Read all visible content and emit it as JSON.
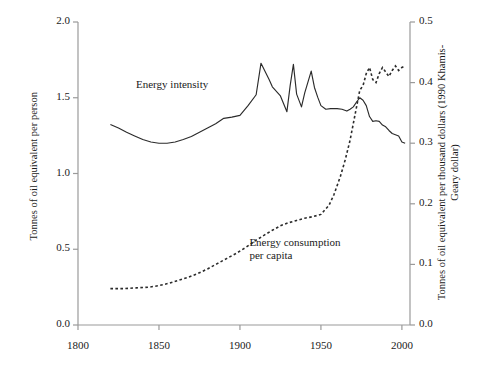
{
  "chart_data": {
    "type": "line",
    "title": "",
    "xlabel": "",
    "ylabel": "Tonnes of oil equivalent per person",
    "ylabel_right": "Tonnes of oil equivalent per thousand dollars (1990 Khamis-Geary dollar)",
    "xlim": [
      1800,
      2005
    ],
    "ylim": [
      0.0,
      2.0
    ],
    "ylim_right": [
      0.0,
      0.5
    ],
    "xticks": [
      1800,
      1850,
      1900,
      1950,
      2000
    ],
    "xticklabels": [
      "1800",
      "1850",
      "1900",
      "1950",
      "2000"
    ],
    "yticks": [
      0.0,
      0.5,
      1.0,
      1.5,
      2.0
    ],
    "yticklabels": [
      "0.0",
      "0.5",
      "1.0",
      "1.5",
      "2.0"
    ],
    "yticks_right": [
      0.0,
      0.1,
      0.2,
      0.3,
      0.4,
      0.5
    ],
    "yticklabels_right": [
      "0.0",
      "0.1",
      "0.2",
      "0.3",
      "0.4",
      "0.5"
    ],
    "grid": false,
    "legend_position": "inline-annotations",
    "series": [
      {
        "name": "Energy intensity",
        "axis": "right",
        "style": "solid",
        "color": "#2b2b2b",
        "x": [
          1820,
          1825,
          1830,
          1835,
          1840,
          1845,
          1850,
          1855,
          1860,
          1865,
          1870,
          1875,
          1880,
          1885,
          1890,
          1895,
          1900,
          1905,
          1910,
          1913,
          1918,
          1920,
          1925,
          1929,
          1931,
          1933,
          1935,
          1938,
          1940,
          1944,
          1946,
          1948,
          1950,
          1953,
          1956,
          1960,
          1963,
          1966,
          1968,
          1970,
          1972,
          1974,
          1976,
          1978,
          1980,
          1982,
          1984,
          1986,
          1988,
          1990,
          1992,
          1994,
          1996,
          1998,
          2000,
          2002
        ],
        "y": [
          0.331,
          0.325,
          0.318,
          0.312,
          0.306,
          0.302,
          0.3,
          0.3,
          0.302,
          0.306,
          0.311,
          0.318,
          0.325,
          0.332,
          0.341,
          0.343,
          0.346,
          0.362,
          0.38,
          0.432,
          0.405,
          0.393,
          0.378,
          0.352,
          0.395,
          0.43,
          0.381,
          0.36,
          0.383,
          0.419,
          0.392,
          0.376,
          0.362,
          0.356,
          0.357,
          0.357,
          0.356,
          0.353,
          0.356,
          0.36,
          0.368,
          0.375,
          0.371,
          0.362,
          0.344,
          0.336,
          0.337,
          0.336,
          0.33,
          0.327,
          0.321,
          0.316,
          0.314,
          0.312,
          0.302,
          0.3
        ]
      },
      {
        "name": "Energy consumption per capita",
        "axis": "left",
        "style": "dotted",
        "color": "#2b2b2b",
        "x": [
          1820,
          1828,
          1836,
          1844,
          1850,
          1856,
          1862,
          1868,
          1874,
          1880,
          1886,
          1892,
          1898,
          1904,
          1910,
          1916,
          1920,
          1925,
          1930,
          1935,
          1940,
          1945,
          1950,
          1955,
          1958,
          1962,
          1965,
          1968,
          1970,
          1972,
          1974,
          1976,
          1978,
          1980,
          1982,
          1984,
          1986,
          1988,
          1990,
          1992,
          1994,
          1996,
          1998,
          2000,
          2002
        ],
        "y": [
          0.24,
          0.24,
          0.245,
          0.25,
          0.26,
          0.275,
          0.295,
          0.315,
          0.34,
          0.37,
          0.405,
          0.44,
          0.475,
          0.515,
          0.56,
          0.6,
          0.625,
          0.655,
          0.675,
          0.69,
          0.705,
          0.715,
          0.73,
          0.79,
          0.86,
          0.98,
          1.09,
          1.22,
          1.33,
          1.44,
          1.55,
          1.58,
          1.66,
          1.7,
          1.62,
          1.6,
          1.66,
          1.7,
          1.67,
          1.64,
          1.68,
          1.71,
          1.68,
          1.7,
          1.71
        ]
      }
    ],
    "annotations": [
      {
        "text": "Energy intensity",
        "x": 1863,
        "y_px": 78
      },
      {
        "text": "Energy consumption\nper capita",
        "x": 1933,
        "y_px": 236
      }
    ]
  }
}
